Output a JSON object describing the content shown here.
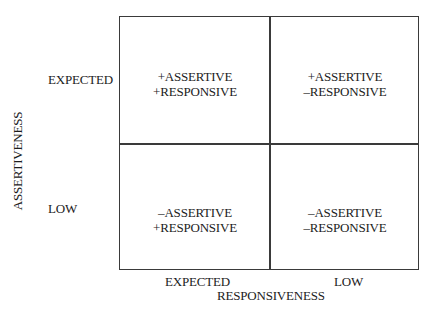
{
  "diagram": {
    "y_axis": {
      "title": "ASSERTIVENESS",
      "levels": [
        "EXPECTED",
        "LOW"
      ]
    },
    "x_axis": {
      "title": "RESPONSIVENESS",
      "levels": [
        "EXPECTED",
        "LOW"
      ]
    },
    "quadrants": {
      "top_left": {
        "line1": "+ASSERTIVE",
        "line2": "+RESPONSIVE"
      },
      "top_right": {
        "line1": "+ASSERTIVE",
        "line2": "–RESPONSIVE"
      },
      "bottom_left": {
        "line1": "–ASSERTIVE",
        "line2": "+RESPONSIVE"
      },
      "bottom_right": {
        "line1": "–ASSERTIVE",
        "line2": "–RESPONSIVE"
      }
    }
  }
}
